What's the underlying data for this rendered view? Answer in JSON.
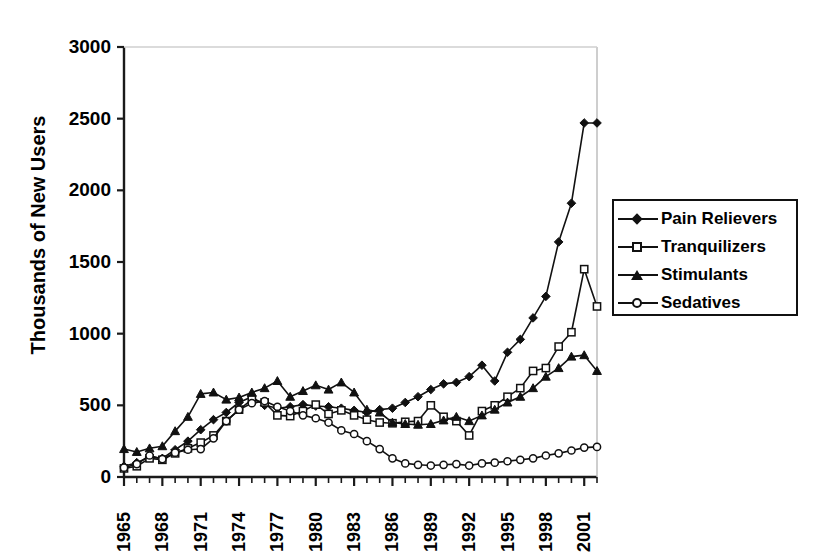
{
  "chart_data": {
    "type": "line",
    "title": "",
    "xlabel": "",
    "ylabel": "Thousands of New Users",
    "ylim": [
      0,
      3000
    ],
    "yticks": [
      0,
      500,
      1000,
      1500,
      2000,
      2500,
      3000
    ],
    "ytick_labels": [
      "0",
      "500",
      "1000",
      "1500",
      "2000",
      "2500",
      "3000"
    ],
    "xlim": [
      1965,
      2002
    ],
    "x": [
      1965,
      1966,
      1967,
      1968,
      1969,
      1970,
      1971,
      1972,
      1973,
      1974,
      1975,
      1976,
      1977,
      1978,
      1979,
      1980,
      1981,
      1982,
      1983,
      1984,
      1985,
      1986,
      1987,
      1988,
      1989,
      1990,
      1991,
      1992,
      1993,
      1994,
      1995,
      1996,
      1997,
      1998,
      1999,
      2000,
      2001,
      2002
    ],
    "xtick_labels": [
      "1965",
      "1968",
      "1971",
      "1974",
      "1977",
      "1980",
      "1983",
      "1986",
      "1989",
      "1992",
      "1995",
      "1998",
      "2001"
    ],
    "xtick_values": [
      1965,
      1968,
      1971,
      1974,
      1977,
      1980,
      1983,
      1986,
      1989,
      1992,
      1995,
      1998,
      2001
    ],
    "grid": false,
    "legend_position": "right",
    "series": [
      {
        "name": "Pain Relievers",
        "marker": "filled-diamond",
        "color": "#111111",
        "values": [
          75,
          100,
          140,
          130,
          190,
          250,
          330,
          400,
          450,
          520,
          560,
          500,
          480,
          490,
          505,
          495,
          490,
          480,
          465,
          450,
          470,
          480,
          520,
          560,
          610,
          650,
          660,
          700,
          780,
          670,
          870,
          960,
          1110,
          1260,
          1640,
          1910,
          2470,
          2470
        ]
      },
      {
        "name": "Tranquilizers",
        "marker": "open-square",
        "color": "#111111",
        "values": [
          60,
          75,
          130,
          120,
          165,
          200,
          240,
          290,
          390,
          470,
          540,
          520,
          430,
          425,
          460,
          505,
          440,
          465,
          430,
          400,
          380,
          375,
          385,
          390,
          500,
          420,
          390,
          290,
          460,
          500,
          560,
          620,
          740,
          760,
          910,
          1010,
          1450,
          1190
        ]
      },
      {
        "name": "Stimulants",
        "marker": "filled-triangle",
        "color": "#111111",
        "values": [
          195,
          175,
          200,
          215,
          320,
          420,
          580,
          590,
          540,
          555,
          590,
          620,
          670,
          560,
          600,
          640,
          610,
          660,
          590,
          470,
          450,
          380,
          370,
          365,
          370,
          395,
          420,
          390,
          430,
          470,
          520,
          560,
          620,
          700,
          760,
          840,
          850,
          740
        ]
      },
      {
        "name": "Sedatives",
        "marker": "open-circle",
        "color": "#111111",
        "values": [
          65,
          90,
          150,
          125,
          170,
          190,
          195,
          270,
          390,
          470,
          515,
          530,
          490,
          460,
          430,
          410,
          380,
          325,
          300,
          250,
          195,
          130,
          95,
          85,
          80,
          85,
          90,
          80,
          95,
          100,
          110,
          120,
          130,
          150,
          165,
          185,
          205,
          210
        ]
      }
    ]
  },
  "legend": {
    "items": [
      {
        "label": "Pain Relievers",
        "marker": "filled-diamond"
      },
      {
        "label": "Tranquilizers",
        "marker": "open-square"
      },
      {
        "label": "Stimulants",
        "marker": "filled-triangle"
      },
      {
        "label": "Sedatives",
        "marker": "open-circle"
      }
    ]
  },
  "axes": {
    "y_title": "Thousands of New Users"
  }
}
